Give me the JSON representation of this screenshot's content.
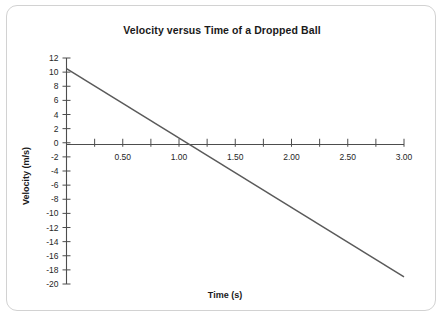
{
  "card": {
    "background_color": "#ffffff",
    "border_color": "#d2d2d2"
  },
  "chart_data": {
    "type": "line",
    "title": "Velocity versus Time of a Dropped Ball",
    "xlabel": "Time (s)",
    "ylabel": "Velocity (m/s)",
    "xlim": [
      0,
      3.0
    ],
    "ylim": [
      -20,
      12
    ],
    "grid": false,
    "legend": null,
    "line_color": "#5a5a5a",
    "axis_color": "#4d4d4d",
    "x_major_ticks": [
      0.5,
      1.0,
      1.5,
      2.0,
      2.5,
      3.0
    ],
    "x_major_tick_labels": [
      "0.50",
      "1.00",
      "1.50",
      "2.00",
      "2.50",
      "3.00"
    ],
    "x_minor_ticks": [
      0.25,
      0.75,
      1.25,
      1.75,
      2.25,
      2.75
    ],
    "y_ticks": [
      12,
      10,
      8,
      6,
      4,
      2,
      0,
      -2,
      -4,
      -6,
      -8,
      -10,
      -12,
      -14,
      -16,
      -18,
      -20
    ],
    "y_tick_labels": [
      "12",
      "10",
      "8",
      "6",
      "4",
      "2",
      "0",
      "-2",
      "-4",
      "-6",
      "-8",
      "-10",
      "-12",
      "-14",
      "-16",
      "-18",
      "-20"
    ],
    "x_axis_position_y": 0,
    "series": [
      {
        "name": "velocity",
        "x": [
          0.0,
          3.0
        ],
        "values": [
          10.5,
          -19.0
        ],
        "slope": -9.83,
        "intercept": 10.5,
        "zero_crossing_x": 1.07
      }
    ]
  }
}
